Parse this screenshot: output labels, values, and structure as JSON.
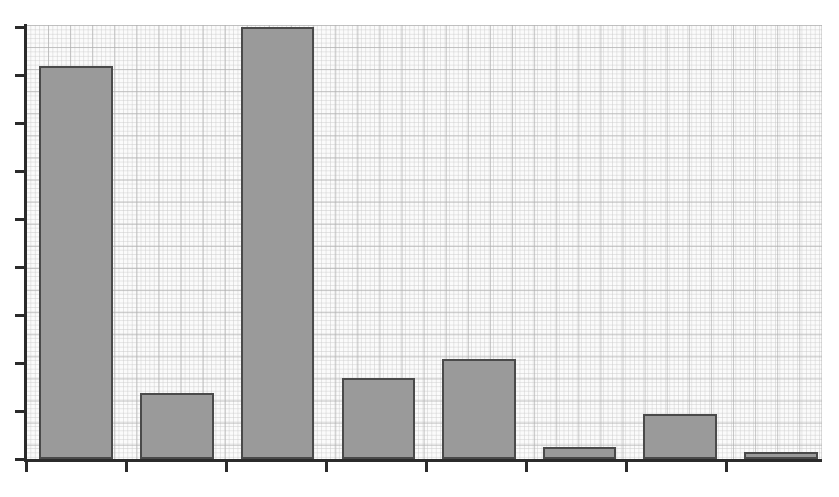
{
  "chart_data": {
    "type": "bar",
    "title": "",
    "subtitle": "",
    "xlabel": "",
    "ylabel": "",
    "grid": true,
    "legend": null,
    "legend_position": "none",
    "categories": [
      "1",
      "2",
      "3",
      "4",
      "5",
      "6",
      "7",
      "8"
    ],
    "values": [
      9.0,
      1.55,
      10.0,
      1.9,
      2.3,
      0.3,
      1.05,
      0.2
    ],
    "series": [
      {
        "name": "Series 1",
        "values": [
          9.0,
          1.55,
          10.0,
          1.9,
          2.3,
          0.3,
          1.05,
          0.2
        ]
      }
    ],
    "ylim": [
      0,
      10.83
    ],
    "y_ticks": [
      0,
      1,
      2,
      3,
      4,
      5,
      6,
      7,
      8,
      9
    ],
    "x_tick_labels": [
      "",
      "",
      "",
      "",
      "",
      "",
      "",
      ""
    ],
    "y_tick_labels": [
      "",
      "",
      "",
      "",
      "",
      "",
      "",
      "",
      "",
      ""
    ],
    "annotations": [],
    "bar_fill_color": "#9a9a9a",
    "bar_edge_color": "#4a4a4a",
    "axis_color": "#2b2b2b",
    "plot_background_color": "#fbfbfb",
    "grid_major_color": "#b0b0b0",
    "grid_minor_color": "#cdcdcd",
    "page_background_color": "#ffffff"
  },
  "geometry": {
    "plot_left": 26,
    "plot_top": 25,
    "plot_width": 796,
    "plot_height": 436,
    "baseline_y": 459,
    "y_tick_positions": [
      26,
      74,
      122,
      170,
      218,
      266,
      314,
      362,
      410,
      458
    ],
    "x_tick_positions": [
      25,
      125,
      225,
      325,
      425,
      525,
      625,
      725
    ],
    "bars": [
      {
        "name": "bar-1",
        "left": 39,
        "width": 74,
        "top": 66,
        "height": 393
      },
      {
        "name": "bar-2",
        "left": 140,
        "width": 74,
        "top": 393,
        "height": 66
      },
      {
        "name": "bar-3",
        "left": 241,
        "width": 73,
        "top": 27,
        "height": 432
      },
      {
        "name": "bar-4",
        "left": 342,
        "width": 73,
        "top": 378,
        "height": 81
      },
      {
        "name": "bar-5",
        "left": 442,
        "width": 74,
        "top": 359,
        "height": 100
      },
      {
        "name": "bar-6",
        "left": 543,
        "width": 73,
        "top": 447,
        "height": 12
      },
      {
        "name": "bar-7",
        "left": 643,
        "width": 74,
        "top": 414,
        "height": 45
      },
      {
        "name": "bar-8",
        "left": 744,
        "width": 74,
        "top": 452,
        "height": 7
      }
    ]
  }
}
